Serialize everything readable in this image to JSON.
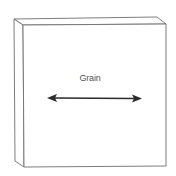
{
  "diagram": {
    "label": "Grain",
    "colors": {
      "outline": "#6e6e6e",
      "arrow": "#2b2b2b",
      "text": "#555555",
      "background": "#ffffff"
    }
  }
}
